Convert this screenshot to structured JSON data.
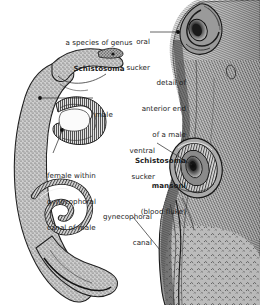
{
  "figure": {
    "title_block": {
      "line1": "a species of genus",
      "line2": "Schistosoma"
    },
    "detail_block": {
      "line1": "detail of",
      "line2": "anterior end",
      "line3": "of a male",
      "line4": "Schistosoma",
      "line5": "mansoni",
      "line6": "(blood fluke)"
    },
    "labels": {
      "oral_sucker": {
        "line1": "oral",
        "line2": "sucker"
      },
      "male": {
        "line1": "male"
      },
      "ventral_sucker": {
        "line1": "ventral",
        "line2": "sucker"
      },
      "female_within": {
        "line1": "female within",
        "line2": "gynecophoral",
        "line3": "canal of male"
      },
      "gynecophoral_canal": {
        "line1": "gynecophoral",
        "line2": "canal"
      }
    },
    "colors": {
      "text": "#1c1c1c",
      "background": "#ffffff",
      "leader_line": "#2a2a2a",
      "ink_dark": "#1a1a1a",
      "ink_mid": "#6f6f6f",
      "ink_light": "#b8b8b8"
    },
    "illustrations": {
      "left": "male-schistosoma-pair-with-female-in-gynecophoral-canal",
      "right": "anterior-end-of-male-schistosoma-mansoni"
    }
  }
}
